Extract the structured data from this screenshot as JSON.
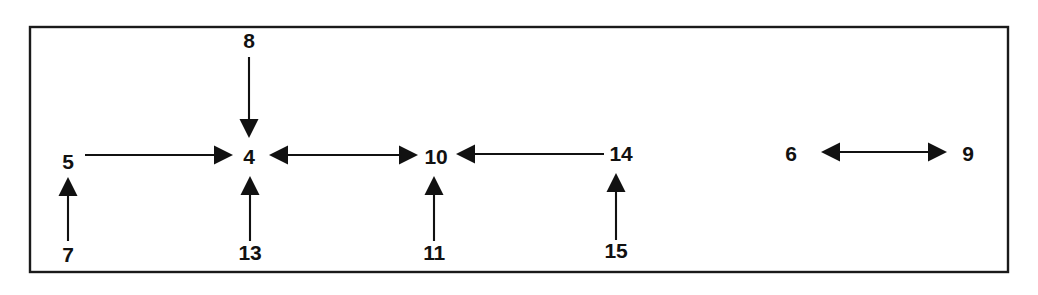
{
  "figure": {
    "kind": "patent-reference-diagram",
    "background_color": "#ffffff",
    "ink_color": "#111111",
    "frame": {
      "name": "outer-border-rectangle",
      "x": 30,
      "y": 27,
      "width": 978,
      "height": 245,
      "stroke_color": "#1a1a1a"
    },
    "labels": [
      {
        "id": "label-8",
        "text": "8",
        "x": 249,
        "y": 42
      },
      {
        "id": "label-5",
        "text": "5",
        "x": 68,
        "y": 163
      },
      {
        "id": "label-4",
        "text": "4",
        "x": 249,
        "y": 158
      },
      {
        "id": "label-10",
        "text": "10",
        "x": 436,
        "y": 158
      },
      {
        "id": "label-14",
        "text": "14",
        "x": 621,
        "y": 155
      },
      {
        "id": "label-6",
        "text": "6",
        "x": 791,
        "y": 155
      },
      {
        "id": "label-9",
        "text": "9",
        "x": 968,
        "y": 155
      },
      {
        "id": "label-7",
        "text": "7",
        "x": 68,
        "y": 256
      },
      {
        "id": "label-13",
        "text": "13",
        "x": 250,
        "y": 254
      },
      {
        "id": "label-11",
        "text": "11",
        "x": 434,
        "y": 254
      },
      {
        "id": "label-15",
        "text": "15",
        "x": 616,
        "y": 252
      }
    ],
    "arrows": [
      {
        "id": "arrow-5-to-4",
        "from_label": "5",
        "to_label": "4",
        "direction": "right",
        "heads": "single",
        "x1": 85,
        "y1": 155,
        "x2": 233,
        "y2": 155
      },
      {
        "id": "arrow-8-to-4",
        "from_label": "8",
        "to_label": "4",
        "direction": "down",
        "heads": "single",
        "x1": 249,
        "y1": 57,
        "x2": 249,
        "y2": 138
      },
      {
        "id": "arrow-13-to-4",
        "from_label": "13",
        "to_label": "4",
        "direction": "up",
        "heads": "single",
        "x1": 250,
        "y1": 241,
        "x2": 250,
        "y2": 176
      },
      {
        "id": "arrow-4-to-10-double",
        "from_label": "4",
        "to_label": "10",
        "direction": "both",
        "heads": "double",
        "x1": 269,
        "y1": 155,
        "x2": 418,
        "y2": 155
      },
      {
        "id": "arrow-14-to-10",
        "from_label": "14",
        "to_label": "10",
        "direction": "left",
        "heads": "single",
        "x1": 604,
        "y1": 154,
        "x2": 456,
        "y2": 154
      },
      {
        "id": "arrow-11-to-10",
        "from_label": "11",
        "to_label": "10",
        "direction": "up",
        "heads": "single",
        "x1": 434,
        "y1": 241,
        "x2": 434,
        "y2": 176
      },
      {
        "id": "arrow-15-to-14",
        "from_label": "15",
        "to_label": "14",
        "direction": "up",
        "heads": "single",
        "x1": 616,
        "y1": 240,
        "x2": 616,
        "y2": 173
      },
      {
        "id": "arrow-7-to-5",
        "from_label": "7",
        "to_label": "5",
        "direction": "up",
        "heads": "single",
        "x1": 68,
        "y1": 241,
        "x2": 68,
        "y2": 177
      },
      {
        "id": "arrow-6-to-9-double",
        "from_label": "6",
        "to_label": "9",
        "direction": "both",
        "heads": "double",
        "x1": 821,
        "y1": 152,
        "x2": 947,
        "y2": 152
      }
    ]
  }
}
